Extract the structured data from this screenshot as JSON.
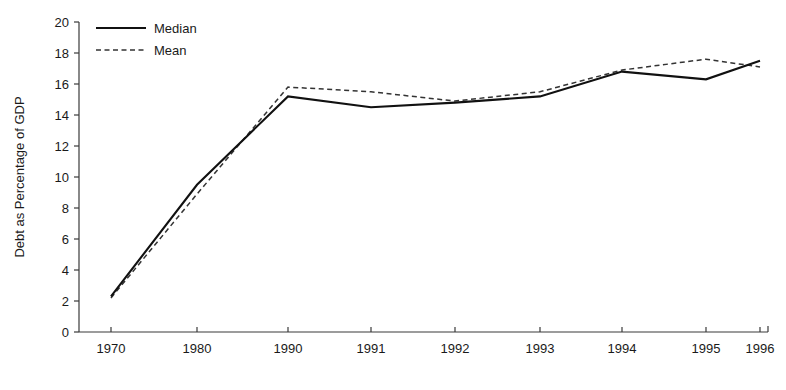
{
  "chart_data": {
    "type": "line",
    "title": "",
    "xlabel": "",
    "ylabel": "Debt as Percentage of GDP",
    "categories": [
      "1970",
      "1980",
      "1990",
      "1991",
      "1992",
      "1993",
      "1994",
      "1995",
      "1996"
    ],
    "ylim": [
      0,
      20
    ],
    "ytick_step": 2,
    "yticks": [
      "0",
      "2",
      "4",
      "6",
      "8",
      "10",
      "12",
      "14",
      "16",
      "18",
      "20"
    ],
    "grid": false,
    "legend_position": "top-left",
    "series": [
      {
        "name": "Median",
        "style": "solid",
        "color": "#111111",
        "values": [
          2.3,
          9.5,
          15.2,
          14.5,
          14.8,
          15.2,
          16.8,
          16.3,
          17.5
        ]
      },
      {
        "name": "Mean",
        "style": "dashed",
        "color": "#333333",
        "values": [
          2.2,
          8.9,
          15.8,
          15.5,
          14.9,
          15.5,
          16.9,
          17.6,
          17.1
        ]
      }
    ]
  },
  "legend": {
    "items": [
      {
        "label": "Median",
        "style": "solid"
      },
      {
        "label": "Mean",
        "style": "dashed"
      }
    ]
  }
}
